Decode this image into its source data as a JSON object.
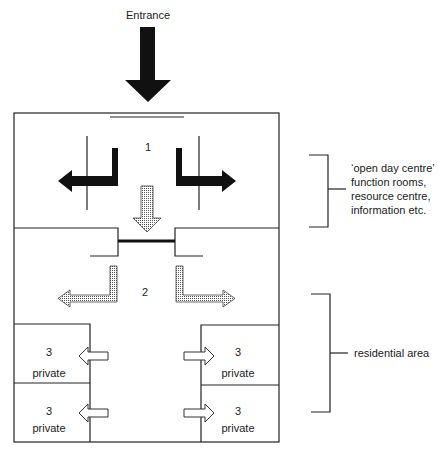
{
  "diagram": {
    "entrance_label": "Entrance",
    "zones": {
      "zone1": {
        "number": "1"
      },
      "zone2": {
        "number": "2"
      },
      "rooms": [
        {
          "number": "3",
          "label": "private",
          "side": "left",
          "row": 1
        },
        {
          "number": "3",
          "label": "private",
          "side": "right",
          "row": 1
        },
        {
          "number": "3",
          "label": "private",
          "side": "left",
          "row": 2
        },
        {
          "number": "3",
          "label": "private",
          "side": "right",
          "row": 2
        }
      ]
    },
    "brackets": {
      "upper": {
        "lines": [
          "‘open day centre’",
          "function rooms,",
          "resource centre,",
          "information etc."
        ]
      },
      "lower": {
        "label": "residential area"
      }
    },
    "arrow_styles": {
      "entrance": "solid-black",
      "zone1_exits": "solid-black",
      "zone1_to_zone2": "dotted",
      "zone2_exits": "dotted",
      "room_entries": "hollow"
    },
    "colors": {
      "line": "#222222",
      "solid_arrow": "#111111",
      "background": "#ffffff"
    }
  }
}
